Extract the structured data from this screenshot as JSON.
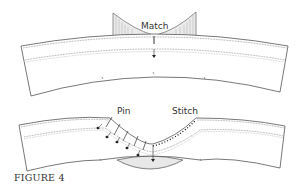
{
  "diagram": {
    "top": {
      "label": "Match"
    },
    "bottom": {
      "label_pin": "Pin",
      "label_stitch": "Stitch"
    },
    "caption": "FIGURE 4",
    "colors": {
      "line": "#555555",
      "fill_shade": "#e6e6e6",
      "pin_head": "#222222",
      "text": "#333333"
    }
  }
}
